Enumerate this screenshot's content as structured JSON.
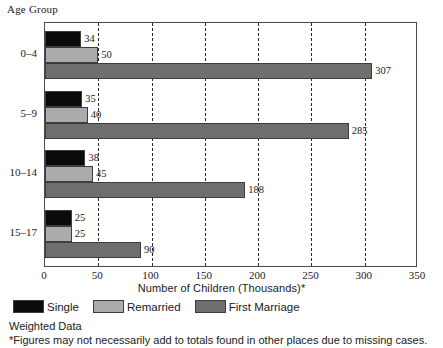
{
  "chart_data": {
    "type": "bar",
    "orientation": "horizontal",
    "title": "",
    "ylabel": "Age Group",
    "xlabel": "Number of Children (Thousands)*",
    "categories": [
      "0–4",
      "5–9",
      "10–14",
      "15–17"
    ],
    "series": [
      {
        "name": "Single",
        "color": "#0b0b0b",
        "values": [
          34,
          35,
          38,
          25
        ]
      },
      {
        "name": "Remarried",
        "color": "#ababab",
        "values": [
          50,
          40,
          45,
          25
        ]
      },
      {
        "name": "First Marriage",
        "color": "#6e6e6e",
        "values": [
          307,
          285,
          188,
          90
        ]
      }
    ],
    "xlim": [
      0,
      350
    ],
    "xticks": [
      0,
      50,
      100,
      150,
      200,
      250,
      300,
      350
    ],
    "xticklabels": [
      "0",
      "50",
      "100",
      "150",
      "200",
      "250",
      "300",
      "350"
    ],
    "grid": "vertical-dashed",
    "legend_position": "below-axis-left",
    "data_labels": true
  },
  "axis": {
    "group_caption": "Age Group",
    "x_title": "Number of Children (Thousands)*"
  },
  "legend": {
    "items": [
      {
        "label": "Single",
        "swatch": "single"
      },
      {
        "label": "Remarried",
        "swatch": "remarried"
      },
      {
        "label": "First Marriage",
        "swatch": "firstmarr"
      }
    ]
  },
  "notes": [
    "Weighted Data",
    "*Figures may not necessarily add to totals found in other places due to missing cases."
  ]
}
